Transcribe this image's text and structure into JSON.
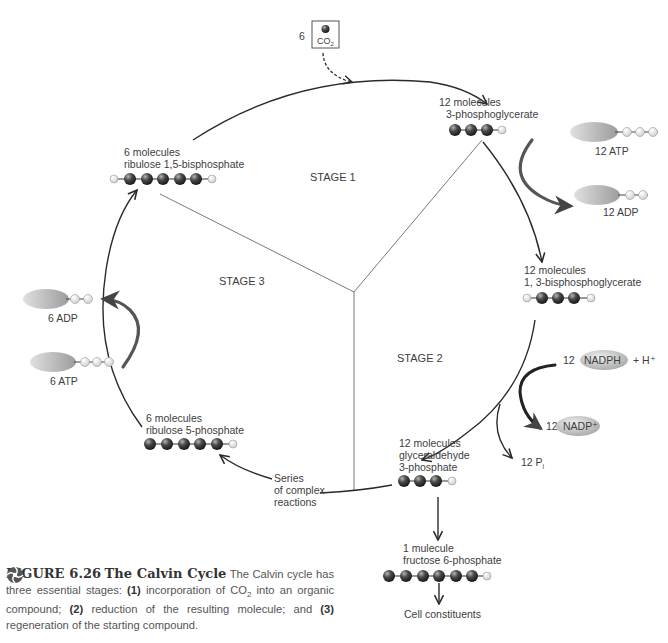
{
  "figure": {
    "number_label": "FIGURE 6.26",
    "title": "The Calvin Cycle",
    "caption_parts": {
      "intro": "The Calvin cycle has three essential stages: ",
      "n1": "(1)",
      "t1a": " incorporation of CO",
      "t1sub": "2",
      "t1b": " into an organic compound; ",
      "n2": "(2)",
      "t2": " reduction of the resulting molecule; and ",
      "n3": "(3)",
      "t3": " regeneration of the starting compound."
    }
  },
  "stages": {
    "stage1": "STAGE 1",
    "stage2": "STAGE 2",
    "stage3": "STAGE 3"
  },
  "co2_input": {
    "count": "6",
    "formula": "CO",
    "subscript": "2"
  },
  "molecules": {
    "pga": {
      "line1": "12 molecules",
      "line2": "3-phosphoglycerate",
      "carbons": 3,
      "phosphates": 1
    },
    "bpg": {
      "line1": "12 molecules",
      "line2": "1, 3-bisphosphoglycerate",
      "carbons": 3,
      "phosphates": 2
    },
    "g3p": {
      "line1": "12 molecules",
      "line2": "glyceraldehyde",
      "line3": "3-phosphate",
      "carbons": 3,
      "phosphates": 1
    },
    "f6p": {
      "line1": "1 mulecule",
      "line2": "fructose 6-phosphate",
      "carbons": 6,
      "phosphates": 1
    },
    "r5p": {
      "line1": "6 molecules",
      "line2": "ribulose 5-phosphate",
      "carbons": 5,
      "phosphates": 1
    },
    "rubp": {
      "line1": "6 molecules",
      "line2": "ribulose 1,5-bisphosphate",
      "carbons": 5,
      "phosphates": 2
    }
  },
  "energy": {
    "atp_stage2": "12 ATP",
    "adp_stage2": "12 ADP",
    "nadph_count": "12",
    "nadph": "NADPH",
    "h_plus": "+ H⁺",
    "nadp_count": "12",
    "nadp": "NADP⁺",
    "pi": "12 P",
    "pi_sub": "i",
    "atp_stage3": "6 ATP",
    "adp_stage3": "6 ADP"
  },
  "other_labels": {
    "series_line1": "Series",
    "series_line2": "of complex",
    "series_line3": "reactions",
    "cell_constituents": "Cell constituents"
  },
  "colors": {
    "carbon": "#3a3a3a",
    "phosphate": "#e6e6e6",
    "nucleotide": "#b8b8b8",
    "arrow": "#2a2a2a",
    "divider": "#777777"
  }
}
